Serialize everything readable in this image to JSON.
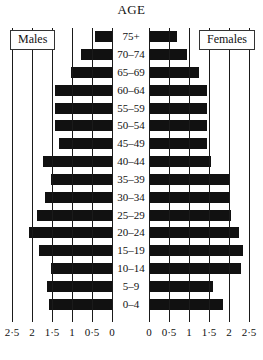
{
  "chart_data": {
    "type": "bar",
    "title": "AGE",
    "subtitle": "",
    "xlabel": "",
    "ylabel": "AGE",
    "orientation": "horizontal",
    "style": "population-pyramid",
    "grid": true,
    "legend_position": "top-outer",
    "categories": [
      "75+",
      "70–74",
      "65–69",
      "60–64",
      "55–59",
      "50–54",
      "45–49",
      "40–44",
      "35–39",
      "30–34",
      "25–29",
      "20–24",
      "15–19",
      "10–14",
      "5–9",
      "0–4"
    ],
    "left_axis": {
      "name": "Males",
      "direction": "left",
      "ticks": [
        0,
        0.5,
        1,
        1.5,
        2,
        2.5
      ],
      "tick_labels": [
        "0",
        "0·5",
        "1",
        "1·5",
        "2",
        "2·5"
      ],
      "range": [
        0,
        2.5
      ]
    },
    "right_axis": {
      "name": "Females",
      "direction": "right",
      "ticks": [
        0,
        0.5,
        1,
        1.5,
        2,
        2.5
      ],
      "tick_labels": [
        "0",
        "0·5",
        "1",
        "1·5",
        "2",
        "2·5"
      ],
      "range": [
        0,
        2.5
      ]
    },
    "series": [
      {
        "name": "Males",
        "values": [
          0.45,
          0.8,
          1.05,
          1.45,
          1.45,
          1.45,
          1.35,
          1.75,
          1.55,
          1.7,
          1.9,
          2.1,
          1.85,
          1.55,
          1.65,
          1.6
        ]
      },
      {
        "name": "Females",
        "values": [
          0.7,
          0.95,
          1.25,
          1.45,
          1.45,
          1.45,
          1.45,
          1.55,
          2.0,
          2.0,
          2.05,
          2.25,
          2.35,
          2.3,
          1.6,
          1.85
        ]
      }
    ],
    "bar_color": "#111111",
    "axis_color": "#1a1a1a"
  },
  "labels": {
    "males_box": "Males",
    "females_box": "Females"
  }
}
